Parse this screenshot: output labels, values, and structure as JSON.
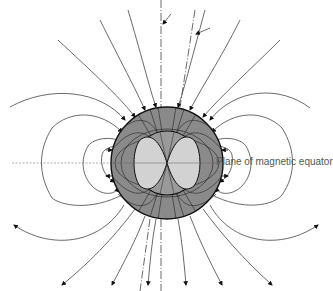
{
  "diagram": {
    "title": "",
    "type": "magnetic field lines around a sphere",
    "labels": {
      "equator": "Plane of magnetic equator"
    },
    "colors": {
      "sphere_fill": "#8a8a8a",
      "inner_lobes_fill": "#cfcfcf",
      "line": "#333333",
      "background": "#ffffff"
    },
    "sphere": {
      "cx": 167,
      "cy": 163,
      "r": 56
    },
    "inner_core": {
      "cx": 167,
      "cy": 163,
      "r": 32
    }
  }
}
